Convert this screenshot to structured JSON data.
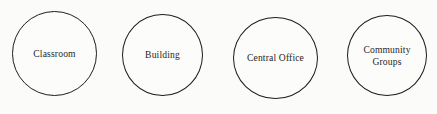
{
  "canvas": {
    "width": 437,
    "height": 114,
    "background_color": "#fbfbfa"
  },
  "diagram": {
    "type": "node-diagram",
    "shape": "circle",
    "outline_color": "#1d1d1d",
    "fill_color": "#fcfcfb",
    "text_color": "#1f1f1f",
    "nodes": [
      {
        "label": "Classroom"
      },
      {
        "label": "Building"
      },
      {
        "label": "Central Office"
      },
      {
        "label": "Community\nGroups"
      }
    ]
  }
}
